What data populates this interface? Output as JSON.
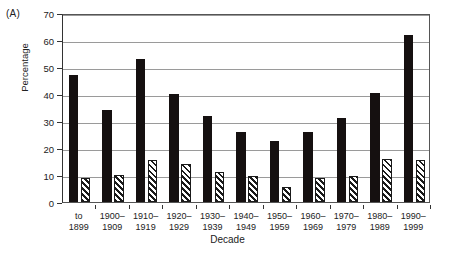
{
  "panel": {
    "label": "(A)"
  },
  "axes": {
    "ylabel": "Percentage",
    "xlabel": "Decade",
    "yticks": [
      "0",
      "10",
      "20",
      "30",
      "40",
      "50",
      "60",
      "70"
    ]
  },
  "chart_data": {
    "type": "bar",
    "title": "",
    "subtitle": "",
    "xlabel": "Decade",
    "ylabel": "Percentage",
    "ylim": [
      0,
      70
    ],
    "ytick_step": 10,
    "grid": true,
    "legend": false,
    "legend_position": "none",
    "categories": [
      "to\n1899",
      "1900–\n1909",
      "1910–\n1919",
      "1920–\n1929",
      "1930–\n1939",
      "1940–\n1949",
      "1950–\n1959",
      "1960–\n1969",
      "1970–\n1979",
      "1980–\n1989",
      "1990–\n1999"
    ],
    "series": [
      {
        "name": "solid",
        "fill": "solid-black",
        "color": "#151010",
        "values": [
          47,
          34,
          53,
          40,
          32,
          26,
          22.5,
          26,
          31,
          40.5,
          62
        ]
      },
      {
        "name": "hatched",
        "fill": "diagonal-hatch",
        "color": "#1a1a1a",
        "values": [
          9,
          10,
          15.5,
          14,
          11,
          9.5,
          5.5,
          9,
          9.5,
          16,
          15.5
        ]
      }
    ]
  }
}
